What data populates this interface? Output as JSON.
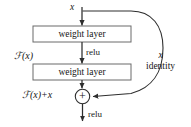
{
  "figure": {
    "type": "flow-diagram"
  },
  "nodes": {
    "weight_layer_1": "weight layer",
    "weight_layer_2": "weight layer",
    "addition": "+"
  },
  "labels": {
    "input_x": "x",
    "relu_mid": "relu",
    "relu_bottom": "relu",
    "function_fx": "ℱ(x)",
    "function_fx_plus_x": "ℱ(x)+x",
    "identity_x": "x",
    "identity_text": "identity"
  },
  "colors": {
    "stroke": "#3a3a3a",
    "box_border": "#6a6a6a",
    "text": "#161616",
    "background": "#ffffff"
  }
}
